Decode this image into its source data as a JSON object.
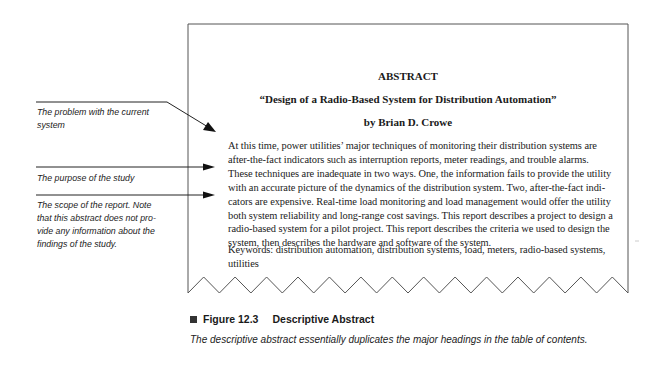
{
  "document": {
    "heading": "ABSTRACT",
    "title": "“Design of a Radio-Based System for Distribution Automation”",
    "author": "by Brian D. Crowe",
    "body_lines": [
      "At this time, power utilities’ major techniques of monitoring their distribution systems are",
      "after-the-fact indicators such as interruption reports, meter readings, and trouble alarms.",
      "These techniques are inadequate in two ways. One, the information fails to provide the utility",
      "with an accurate picture of the dynamics of the distribution system. Two, after-the-fact indi-",
      "cators are expensive. Real-time load monitoring and load management would offer the utility",
      "both system reliability and long-range cost savings. This report describes a project to design a",
      "radio-based system for a pilot project. This report describes the criteria we used to design the",
      "system, then describes the hardware and software of the system."
    ],
    "keywords_lines": [
      "Keywords: distribution automation, distribution systems, load, meters, radio-based systems,",
      "utilities"
    ]
  },
  "annotations": [
    {
      "lines": [
        "The problem with the current",
        "system"
      ]
    },
    {
      "lines": [
        "The purpose of the study"
      ]
    },
    {
      "lines": [
        "The scope of the report. Note",
        "that this abstract does not pro-",
        "vide any information about the",
        "findings of the study."
      ]
    }
  ],
  "caption": {
    "figure_number": "Figure 12.3",
    "figure_title": "Descriptive Abstract",
    "description": "The descriptive abstract essentially duplicates the major headings in the table of contents."
  }
}
